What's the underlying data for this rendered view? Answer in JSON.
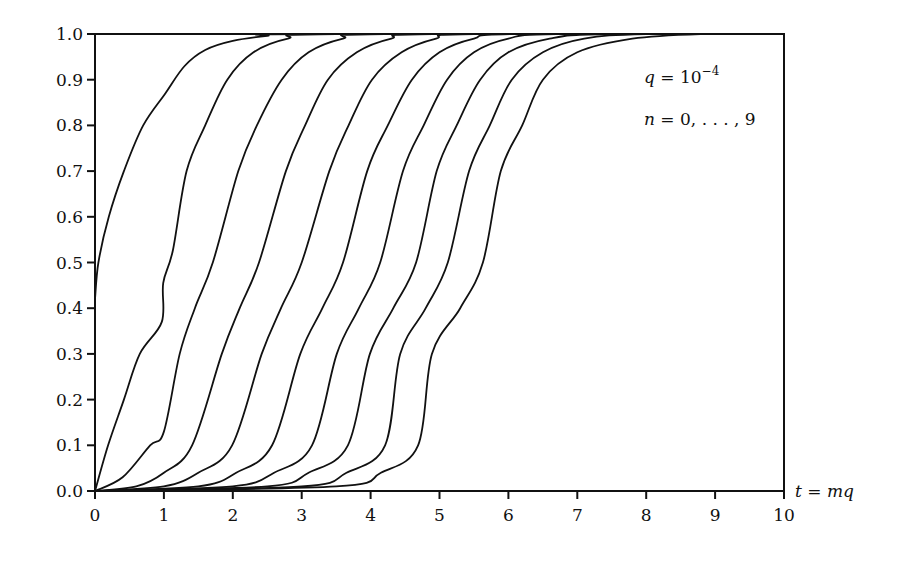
{
  "chart_data": {
    "type": "line",
    "title": "",
    "xlabel": "t = mq",
    "ylabel": "",
    "xlim": [
      0,
      10
    ],
    "ylim": [
      0,
      1
    ],
    "grid": false,
    "legend": null,
    "x_ticks": [
      "0",
      "1",
      "2",
      "3",
      "4",
      "5",
      "6",
      "7",
      "8",
      "9",
      "10"
    ],
    "y_ticks": [
      "0.0",
      "0.1",
      "0.2",
      "0.3",
      "0.4",
      "0.5",
      "0.6",
      "0.7",
      "0.8",
      "0.9",
      "1.0"
    ],
    "annotations": [
      {
        "text": "q = 10^-4",
        "parts": {
          "var": "q",
          "eq": " = 10",
          "sup": "−4"
        }
      },
      {
        "text": "n = 0, . . . , 9",
        "parts": {
          "var": "n",
          "eq": " = 0, . . . , 9"
        }
      }
    ],
    "series": [
      {
        "name": "n=0",
        "points": [
          [
            0,
            0.42
          ],
          [
            0.05,
            0.5
          ],
          [
            0.2,
            0.6
          ],
          [
            0.42,
            0.7
          ],
          [
            0.7,
            0.8
          ],
          [
            1.02,
            0.87
          ],
          [
            1.3,
            0.93
          ],
          [
            1.6,
            0.965
          ],
          [
            2.0,
            0.985
          ],
          [
            2.5,
            0.996
          ],
          [
            3.0,
            1.0
          ]
        ]
      },
      {
        "name": "n=1",
        "points": [
          [
            0,
            0
          ],
          [
            0.19,
            0.1
          ],
          [
            0.42,
            0.2
          ],
          [
            0.65,
            0.3
          ],
          [
            0.97,
            0.37
          ],
          [
            0.99,
            0.455
          ],
          [
            1.13,
            0.527
          ],
          [
            1.33,
            0.7
          ],
          [
            1.6,
            0.8
          ],
          [
            1.92,
            0.9
          ],
          [
            2.3,
            0.96
          ],
          [
            2.8,
            0.99
          ],
          [
            3.5,
            1.0
          ]
        ]
      },
      {
        "name": "n=2",
        "points": [
          [
            0,
            0
          ],
          [
            0.4,
            0.03
          ],
          [
            0.8,
            0.1
          ],
          [
            1.0,
            0.13
          ],
          [
            1.23,
            0.3
          ],
          [
            1.45,
            0.4
          ],
          [
            1.71,
            0.5
          ],
          [
            2.08,
            0.7
          ],
          [
            2.35,
            0.8
          ],
          [
            2.71,
            0.9
          ],
          [
            3.1,
            0.96
          ],
          [
            3.6,
            0.99
          ],
          [
            4.2,
            1.0
          ]
        ]
      },
      {
        "name": "n=3",
        "points": [
          [
            0,
            0
          ],
          [
            0.6,
            0.01
          ],
          [
            1.0,
            0.04
          ],
          [
            1.41,
            0.1
          ],
          [
            1.84,
            0.3
          ],
          [
            2.1,
            0.4
          ],
          [
            2.38,
            0.5
          ],
          [
            2.77,
            0.7
          ],
          [
            3.05,
            0.8
          ],
          [
            3.38,
            0.9
          ],
          [
            3.8,
            0.96
          ],
          [
            4.3,
            0.99
          ],
          [
            4.9,
            1.0
          ]
        ]
      },
      {
        "name": "n=4",
        "points": [
          [
            0,
            0
          ],
          [
            1.0,
            0.01
          ],
          [
            1.5,
            0.04
          ],
          [
            1.99,
            0.1
          ],
          [
            2.42,
            0.3
          ],
          [
            2.7,
            0.4
          ],
          [
            3.0,
            0.5
          ],
          [
            3.4,
            0.7
          ],
          [
            3.68,
            0.8
          ],
          [
            4.02,
            0.9
          ],
          [
            4.45,
            0.96
          ],
          [
            4.95,
            0.99
          ],
          [
            5.5,
            1.0
          ]
        ]
      },
      {
        "name": "n=5",
        "points": [
          [
            0,
            0
          ],
          [
            1.5,
            0.01
          ],
          [
            2.05,
            0.04
          ],
          [
            2.57,
            0.1
          ],
          [
            2.98,
            0.3
          ],
          [
            3.3,
            0.4
          ],
          [
            3.6,
            0.5
          ],
          [
            3.95,
            0.7
          ],
          [
            4.25,
            0.8
          ],
          [
            4.6,
            0.9
          ],
          [
            5.0,
            0.96
          ],
          [
            5.5,
            0.99
          ],
          [
            6.1,
            1.0
          ]
        ]
      },
      {
        "name": "n=6",
        "points": [
          [
            0,
            0
          ],
          [
            2.0,
            0.01
          ],
          [
            2.6,
            0.04
          ],
          [
            3.15,
            0.1
          ],
          [
            3.51,
            0.3
          ],
          [
            3.83,
            0.4
          ],
          [
            4.14,
            0.5
          ],
          [
            4.47,
            0.7
          ],
          [
            4.77,
            0.8
          ],
          [
            5.11,
            0.9
          ],
          [
            5.5,
            0.96
          ],
          [
            6.0,
            0.99
          ],
          [
            6.7,
            1.0
          ]
        ]
      },
      {
        "name": "n=7",
        "points": [
          [
            0,
            0
          ],
          [
            2.5,
            0.01
          ],
          [
            3.1,
            0.04
          ],
          [
            3.67,
            0.1
          ],
          [
            3.99,
            0.3
          ],
          [
            4.33,
            0.4
          ],
          [
            4.66,
            0.5
          ],
          [
            4.96,
            0.7
          ],
          [
            5.25,
            0.8
          ],
          [
            5.59,
            0.9
          ],
          [
            6.0,
            0.96
          ],
          [
            6.6,
            0.99
          ],
          [
            7.4,
            1.0
          ]
        ]
      },
      {
        "name": "n=8",
        "points": [
          [
            0,
            0
          ],
          [
            3.0,
            0.01
          ],
          [
            3.65,
            0.04
          ],
          [
            4.21,
            0.1
          ],
          [
            4.43,
            0.3
          ],
          [
            4.8,
            0.4
          ],
          [
            5.12,
            0.5
          ],
          [
            5.43,
            0.7
          ],
          [
            5.73,
            0.8
          ],
          [
            6.05,
            0.9
          ],
          [
            6.5,
            0.96
          ],
          [
            7.1,
            0.99
          ],
          [
            8.0,
            1.0
          ]
        ]
      },
      {
        "name": "n=9",
        "points": [
          [
            0,
            0
          ],
          [
            3.5,
            0.01
          ],
          [
            4.15,
            0.04
          ],
          [
            4.69,
            0.1
          ],
          [
            4.89,
            0.3
          ],
          [
            5.3,
            0.4
          ],
          [
            5.63,
            0.5
          ],
          [
            5.89,
            0.7
          ],
          [
            6.2,
            0.8
          ],
          [
            6.5,
            0.9
          ],
          [
            7.0,
            0.96
          ],
          [
            7.8,
            0.99
          ],
          [
            8.8,
            1.0
          ]
        ]
      }
    ]
  }
}
